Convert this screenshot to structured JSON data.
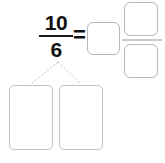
{
  "problem": {
    "type": "improper-fraction-to-mixed-number",
    "fraction": {
      "numerator": "10",
      "denominator": "6",
      "bar": "fraction-bar"
    },
    "operator": "=",
    "answer": {
      "whole_box_value": "",
      "numerator_box_value": "",
      "denominator_box_value": "",
      "bar": "mixed-number-fraction-bar"
    },
    "decomposition": {
      "box_values": [
        "",
        ""
      ],
      "connector_style": "dotted",
      "connector_color": "#bdbdbd"
    }
  },
  "colors": {
    "background": "#ffffff",
    "text": "#111111",
    "fraction_bar": "#1a1a1a",
    "box_border": "#b8b8b8",
    "decomposition_box_border": "#c2c2c2",
    "mixed_bar": "#cfc9c0"
  }
}
